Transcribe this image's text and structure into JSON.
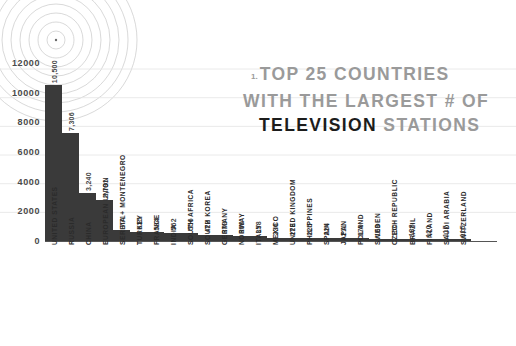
{
  "title": {
    "marker": "1.",
    "line1": "TOP 25 COUNTRIES",
    "line2": "WITH THE LARGEST # OF",
    "line3_emphasis": "TELEVISION",
    "line3_rest": " STATIONS"
  },
  "colors": {
    "bar": "#3a3a3a",
    "axis": "#555555",
    "grid": "#e2e2e2",
    "title_muted": "#9a9a9a",
    "title_emphasis": "#1c1c1c",
    "label": "#2b2b2b",
    "background": "#ffffff"
  },
  "chart_data": {
    "type": "bar",
    "title": "TOP 25 COUNTRIES WITH THE LARGEST # OF TELEVISION STATIONS",
    "xlabel": "",
    "ylabel": "",
    "ylim": [
      0,
      13000
    ],
    "grid": true,
    "legend": "none",
    "yticks": [
      0,
      2000,
      4000,
      6000,
      8000,
      10000,
      12000
    ],
    "ytick_labels": [
      "0",
      "2000",
      "4000",
      "6000",
      "8000",
      "10000",
      "12000"
    ],
    "categories": [
      "UNITED STATES",
      "RUSSIA",
      "CHINA",
      "EUROPEAN UNION",
      "SERBIA + MONTENEGRO",
      "TURKEY",
      "FRANCE",
      "INDIA",
      "SOUTH AFRICA",
      "SOUTH KOREA",
      "GERMANY",
      "NORWAY",
      "ITALY",
      "MEXICO",
      "UNITED KINGDOM",
      "PHILIPPINES",
      "SPAIN",
      "JAPAN",
      "POLAND",
      "SWEDEN",
      "CZECH REPUBLIC",
      "BRAZIL",
      "FINLAND",
      "SAUDI ARABIA",
      "SWITZERLAND"
    ],
    "values": [
      10500,
      7306,
      3240,
      2791,
      771,
      635,
      584,
      562,
      556,
      422,
      373,
      360,
      358,
      236,
      228,
      225,
      224,
      211,
      179,
      169,
      150,
      138,
      120,
      117,
      115
    ],
    "value_labels": [
      "10,500",
      "7,306",
      "3,240",
      "2,791",
      "771",
      "635",
      "584",
      "562",
      "556",
      "422",
      "373",
      "360",
      "358",
      "236",
      "228",
      "225",
      "224",
      "211",
      "179",
      "169",
      "150",
      "138",
      "120",
      "117",
      "115"
    ]
  }
}
